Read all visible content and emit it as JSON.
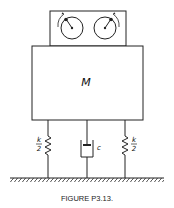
{
  "diagram": {
    "mass_label": "M",
    "spring_left": {
      "numerator": "k",
      "denominator": "2"
    },
    "spring_right": {
      "numerator": "k",
      "denominator": "2"
    },
    "damper_label": "c",
    "components": [
      "rotating-unbalance-box",
      "mass-block",
      "spring-left",
      "damper",
      "spring-right",
      "ground"
    ]
  },
  "caption": "FIGURE P3.13."
}
